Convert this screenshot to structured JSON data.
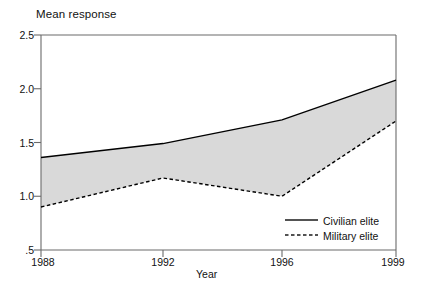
{
  "chart_data": {
    "type": "line",
    "title": "Mean response",
    "xlabel": "Year",
    "ylabel": "",
    "x": [
      1988,
      1992,
      1996,
      1999
    ],
    "xtick_labels": [
      "1988",
      "1992",
      "1996",
      "1999"
    ],
    "ytick_labels": [
      "2.5",
      "2.0",
      "1.5",
      "1.0",
      ".5"
    ],
    "ytick_values": [
      2.5,
      2.0,
      1.5,
      1.0,
      0.5
    ],
    "ylim": [
      0.5,
      2.5
    ],
    "xlim": [
      1988,
      1999
    ],
    "grid": false,
    "legend_position": "bottom-right",
    "fill_between": true,
    "fill_color": "#d9d9d9",
    "series": [
      {
        "name": "Civilian elite",
        "style": "solid",
        "color": "#000000",
        "values": [
          1.36,
          1.49,
          1.71,
          2.08
        ]
      },
      {
        "name": "Military elite",
        "style": "dashed",
        "color": "#000000",
        "values": [
          0.9,
          1.17,
          1.0,
          1.7
        ]
      }
    ]
  },
  "legend": {
    "items": [
      {
        "label": "Civilian elite",
        "style": "solid"
      },
      {
        "label": "Military elite",
        "style": "dashed"
      }
    ]
  },
  "colors": {
    "axis": "#6b6b6b",
    "line": "#1a1a1a",
    "fill": "#d9d9d9",
    "text": "#111111",
    "background": "#ffffff"
  }
}
